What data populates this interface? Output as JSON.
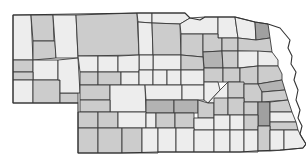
{
  "map": {
    "title": "Nebraska counties",
    "region": "Nebraska",
    "shades": {
      "light": "#ededed",
      "mid": "#cccccc",
      "dark": "#b3b3b3",
      "darker": "#a0a0a0"
    },
    "outline": "M13,15 L140,13 L185,13 L190,18 L200,20 L205,17 L235,17 L255,22 L268,24 L280,28 L285,34 L290,40 L288,48 L292,56 L291,64 L296,72 L294,80 L298,90 L296,100 L300,110 L298,118 L302,126 L300,134 L306,144 L303,148 L280,150 L255,151 L240,152 L200,152 L160,152 L120,153 L78,153 L78,103 L13,103 Z",
    "counties": [
      {
        "id": "sioux",
        "d": "M13,15 L31,15 L33,60 L13,60 Z",
        "shade": "light"
      },
      {
        "id": "dawes",
        "d": "M31,15 L53,15 L54,41 L33,41 Z",
        "shade": "mid"
      },
      {
        "id": "box-butte",
        "d": "M33,41 L55,41 L56,58 L33,60 Z",
        "shade": "mid"
      },
      {
        "id": "sheridan",
        "d": "M53,15 L76,15 L78,58 L56,58 Z",
        "shade": "light"
      },
      {
        "id": "cherry",
        "d": "M76,15 L137,13 L139,55 L78,56 Z",
        "shade": "mid"
      },
      {
        "id": "keya-paha",
        "d": "M137,13 L152,13 L152,23 L138,22 Z",
        "shade": "light"
      },
      {
        "id": "rock",
        "d": "M138,22 L152,23 L153,55 L139,55 Z",
        "shade": "light"
      },
      {
        "id": "boyd",
        "d": "M152,13 L185,13 L190,18 L180,24 L152,23 Z",
        "shade": "light"
      },
      {
        "id": "holt",
        "d": "M152,23 L180,24 L181,55 L153,55 Z",
        "shade": "mid"
      },
      {
        "id": "knox",
        "d": "M180,24 L190,18 L205,17 L218,17 L218,34 L181,34 Z",
        "shade": "light"
      },
      {
        "id": "cedar",
        "d": "M218,17 L235,17 L238,38 L218,38 Z",
        "shade": "light"
      },
      {
        "id": "dixon",
        "d": "M235,17 L255,22 L256,40 L238,38 Z",
        "shade": "light"
      },
      {
        "id": "dakota",
        "d": "M255,22 L268,24 L270,38 L256,40 Z",
        "shade": "darker"
      },
      {
        "id": "antelope",
        "d": "M181,34 L203,34 L203,57 L181,55 Z",
        "shade": "mid"
      },
      {
        "id": "pierce",
        "d": "M203,34 L218,34 L218,38 L222,38 L222,51 L203,52 Z",
        "shade": "mid"
      },
      {
        "id": "wayne",
        "d": "M222,38 L238,38 L238,51 L222,51 Z",
        "shade": "mid"
      },
      {
        "id": "thurston",
        "d": "M238,38 L256,40 L270,38 L272,52 L238,51 Z",
        "shade": "mid"
      },
      {
        "id": "garfield-area",
        "d": "M153,55 L181,55 L181,70 L153,70 Z",
        "shade": "light"
      },
      {
        "id": "wheeler",
        "d": "M139,55 L153,55 L153,70 L139,70 Z",
        "shade": "light"
      },
      {
        "id": "madison",
        "d": "M203,52 L222,51 L223,68 L204,68 Z",
        "shade": "dark"
      },
      {
        "id": "stanton",
        "d": "M222,51 L238,51 L238,68 L223,68 Z",
        "shade": "mid"
      },
      {
        "id": "cuming",
        "d": "M238,51 L258,51 L258,66 L238,68 Z",
        "shade": "light"
      },
      {
        "id": "burt",
        "d": "M258,51 L272,52 L278,60 L278,66 L258,66 Z",
        "shade": "light"
      },
      {
        "id": "boone",
        "d": "M181,55 L203,57 L204,70 L181,70 Z",
        "shade": "mid"
      },
      {
        "id": "scotts-bluff",
        "d": "M13,60 L33,60 L33,72 L13,72 Z",
        "shade": "mid"
      },
      {
        "id": "morrill",
        "d": "M33,60 L58,60 L58,80 L33,80 Z",
        "shade": "light"
      },
      {
        "id": "banner",
        "d": "M13,72 L33,72 L33,80 L13,80 Z",
        "shade": "mid"
      },
      {
        "id": "kimball",
        "d": "M13,80 L33,80 L33,103 L13,103 Z",
        "shade": "light"
      },
      {
        "id": "cheyenne",
        "d": "M33,80 L60,80 L60,103 L33,103 Z",
        "shade": "mid"
      },
      {
        "id": "deuel",
        "d": "M60,93 L78,93 L78,103 L60,103 Z",
        "shade": "mid"
      },
      {
        "id": "garden",
        "d": "M58,60 L78,58 L80,93 L60,93 L60,80 L58,80 Z",
        "shade": "light"
      },
      {
        "id": "grant",
        "d": "M78,56 L98,56 L98,72 L80,72 Z",
        "shade": "light"
      },
      {
        "id": "hooker",
        "d": "M98,56 L118,56 L118,72 L98,72 Z",
        "shade": "light"
      },
      {
        "id": "thomas",
        "d": "M118,56 L139,55 L139,72 L118,72 Z",
        "shade": "light"
      },
      {
        "id": "arthur",
        "d": "M80,72 L98,72 L98,85 L80,85 Z",
        "shade": "mid"
      },
      {
        "id": "mcpherson",
        "d": "M98,72 L121,72 L121,85 L98,85 Z",
        "shade": "mid"
      },
      {
        "id": "logan",
        "d": "M121,72 L139,72 L139,85 L121,85 Z",
        "shade": "light"
      },
      {
        "id": "blaine",
        "d": "M139,70 L153,70 L153,85 L139,85 Z",
        "shade": "light"
      },
      {
        "id": "loup",
        "d": "M153,70 L167,70 L167,85 L153,85 Z",
        "shade": "light"
      },
      {
        "id": "greeley",
        "d": "M167,70 L181,70 L181,85 L167,85 Z",
        "shade": "light"
      },
      {
        "id": "nance",
        "d": "M181,70 L204,70 L204,85 L181,85 Z",
        "shade": "light"
      },
      {
        "id": "platte",
        "d": "M204,68 L223,68 L223,82 L204,82 Z",
        "shade": "mid"
      },
      {
        "id": "colfax",
        "d": "M223,68 L240,68 L240,82 L223,82 Z",
        "shade": "mid"
      },
      {
        "id": "dodge",
        "d": "M240,68 L258,66 L258,84 L240,84 Z",
        "shade": "mid"
      },
      {
        "id": "washington",
        "d": "M258,66 L278,66 L282,74 L282,80 L258,84 Z",
        "shade": "mid"
      },
      {
        "id": "keith",
        "d": "M80,85 L110,85 L110,100 L80,100 Z",
        "shade": "mid"
      },
      {
        "id": "lincoln",
        "d": "M110,85 L145,85 L146,112 L110,112 Z",
        "shade": "light"
      },
      {
        "id": "custer",
        "d": "M145,85 L182,85 L182,100 L146,100 Z",
        "shade": "light"
      },
      {
        "id": "valley-sherman",
        "d": "M182,85 L204,85 L204,100 L182,100 Z",
        "shade": "light"
      },
      {
        "id": "howard",
        "d": "M204,82 L218,82 L220,90 L208,103 L204,100 Z",
        "shade": "light"
      },
      {
        "id": "merrick",
        "d": "M208,103 L220,90 L228,82 L228,103 Z",
        "shade": "light"
      },
      {
        "id": "butler",
        "d": "M228,82 L244,82 L244,98 L228,98 Z",
        "shade": "mid"
      },
      {
        "id": "saunders",
        "d": "M244,84 L262,84 L262,102 L244,102 Z",
        "shade": "mid"
      },
      {
        "id": "douglas",
        "d": "M258,84 L282,80 L285,90 L262,92 Z",
        "shade": "dark"
      },
      {
        "id": "sarpy",
        "d": "M262,92 L285,90 L288,100 L262,102 Z",
        "shade": "mid"
      },
      {
        "id": "perkins",
        "d": "M80,100 L110,100 L110,112 L80,112 Z",
        "shade": "mid"
      },
      {
        "id": "dawson",
        "d": "M146,100 L174,100 L174,113 L146,113 Z",
        "shade": "dark"
      },
      {
        "id": "buffalo",
        "d": "M174,100 L198,100 L198,113 L174,113 Z",
        "shade": "dark"
      },
      {
        "id": "hall",
        "d": "M198,100 L208,103 L214,103 L214,118 L198,118 Z",
        "shade": "mid"
      },
      {
        "id": "hamilton",
        "d": "M214,98 L228,98 L228,115 L214,115 Z",
        "shade": "mid"
      },
      {
        "id": "york",
        "d": "M228,98 L244,98 L244,115 L228,115 Z",
        "shade": "mid"
      },
      {
        "id": "seward",
        "d": "M244,102 L258,102 L258,115 L244,115 Z",
        "shade": "mid"
      },
      {
        "id": "lancaster",
        "d": "M258,102 L270,102 L270,126 L258,126 Z",
        "shade": "darker"
      },
      {
        "id": "cass",
        "d": "M270,102 L288,100 L292,112 L270,112 Z",
        "shade": "mid"
      },
      {
        "id": "otoe",
        "d": "M270,112 L292,112 L296,122 L270,122 Z",
        "shade": "light"
      },
      {
        "id": "chase",
        "d": "M78,112 L98,112 L98,128 L78,128 Z",
        "shade": "mid"
      },
      {
        "id": "hayes",
        "d": "M98,112 L118,112 L118,128 L98,128 Z",
        "shade": "mid"
      },
      {
        "id": "frontier",
        "d": "M118,112 L146,112 L146,128 L118,128 Z",
        "shade": "light"
      },
      {
        "id": "gosper",
        "d": "M146,113 L156,113 L156,128 L146,128 Z",
        "shade": "light"
      },
      {
        "id": "phelps",
        "d": "M156,113 L175,113 L175,128 L156,128 Z",
        "shade": "mid"
      },
      {
        "id": "kearney",
        "d": "M175,113 L194,113 L194,128 L175,128 Z",
        "shade": "mid"
      },
      {
        "id": "adams",
        "d": "M194,118 L214,118 L214,130 L194,130 Z",
        "shade": "light"
      },
      {
        "id": "clay",
        "d": "M214,115 L230,115 L230,130 L214,130 Z",
        "shade": "light"
      },
      {
        "id": "fillmore",
        "d": "M230,115 L244,115 L244,130 L230,130 Z",
        "shade": "light"
      },
      {
        "id": "saline",
        "d": "M244,115 L258,115 L258,130 L244,130 Z",
        "shade": "mid"
      },
      {
        "id": "johnson",
        "d": "M270,122 L296,122 L298,130 L270,130 Z",
        "shade": "mid"
      },
      {
        "id": "dundy",
        "d": "M78,128 L98,128 L98,153 L78,153 Z",
        "shade": "mid"
      },
      {
        "id": "hitchcock",
        "d": "M98,128 L122,128 L122,153 L98,153 Z",
        "shade": "mid"
      },
      {
        "id": "red-willow",
        "d": "M122,128 L142,128 L142,153 L122,153 Z",
        "shade": "mid"
      },
      {
        "id": "furnas",
        "d": "M142,128 L158,128 L158,153 L142,153 Z",
        "shade": "light"
      },
      {
        "id": "harlan",
        "d": "M158,128 L176,128 L176,152 L158,152 Z",
        "shade": "light"
      },
      {
        "id": "franklin",
        "d": "M176,128 L194,128 L194,152 L176,152 Z",
        "shade": "light"
      },
      {
        "id": "webster",
        "d": "M194,130 L214,130 L214,152 L194,152 Z",
        "shade": "light"
      },
      {
        "id": "nuckolls",
        "d": "M214,130 L230,130 L230,152 L214,152 Z",
        "shade": "light"
      },
      {
        "id": "thayer",
        "d": "M230,130 L244,130 L244,152 L230,152 Z",
        "shade": "light"
      },
      {
        "id": "jefferson",
        "d": "M244,130 L258,130 L258,152 L244,152 Z",
        "shade": "light"
      },
      {
        "id": "gage",
        "d": "M258,126 L270,126 L270,151 L258,151 Z",
        "shade": "mid"
      },
      {
        "id": "pawnee",
        "d": "M270,130 L284,130 L284,150 L270,151 Z",
        "shade": "light"
      },
      {
        "id": "richardson",
        "d": "M284,130 L298,130 L302,138 L306,144 L303,148 L284,150 Z",
        "shade": "light"
      }
    ]
  }
}
